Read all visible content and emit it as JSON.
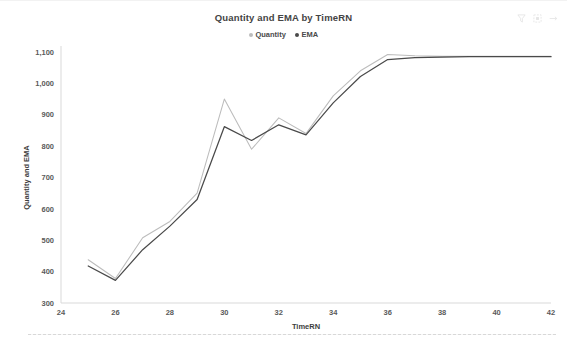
{
  "header": {
    "title": "Quantity and EMA by TimeRN",
    "icons": [
      {
        "name": "filter-icon",
        "label": "Filters"
      },
      {
        "name": "focus-mode-icon",
        "label": "Focus mode"
      },
      {
        "name": "more-options-icon",
        "label": "More options"
      }
    ]
  },
  "legend": {
    "items": [
      {
        "label": "Quantity",
        "color": "#bcbcbc"
      },
      {
        "label": "EMA",
        "color": "#4a4a4a"
      }
    ]
  },
  "colors": {
    "quantity": "#bcbcbc",
    "ema": "#4a4a4a",
    "axis": "#d9d9d9",
    "tick_text": "#5a5a5a",
    "title_text": "#444444",
    "background": "#ffffff"
  },
  "chart_data": {
    "type": "line",
    "title": "Quantity and EMA by TimeRN",
    "xlabel": "TimeRN",
    "ylabel": "Quantity and EMA",
    "xlim": [
      24,
      42
    ],
    "ylim": [
      300,
      1100
    ],
    "xticks": [
      24,
      26,
      28,
      30,
      32,
      34,
      36,
      38,
      40,
      42
    ],
    "xtick_labels": [
      "24",
      "26",
      "28",
      "30",
      "32",
      "34",
      "36",
      "38",
      "40",
      "42"
    ],
    "yticks": [
      300,
      400,
      500,
      600,
      700,
      800,
      900,
      1000,
      1100
    ],
    "ytick_labels": [
      "300",
      "400",
      "500",
      "600",
      "700",
      "800",
      "900",
      "1,000",
      "1,100"
    ],
    "grid": false,
    "legend_position": "top",
    "x": [
      25,
      26,
      27,
      28,
      29,
      30,
      31,
      32,
      33,
      34,
      35,
      36,
      37,
      38,
      39,
      40,
      41,
      42
    ],
    "series": [
      {
        "name": "Quantity",
        "color": "#bcbcbc",
        "values": [
          438,
          378,
          508,
          560,
          650,
          950,
          790,
          890,
          840,
          960,
          1040,
          1092,
          1088,
          1086,
          1086,
          1086,
          1086,
          1086
        ]
      },
      {
        "name": "EMA",
        "color": "#4a4a4a",
        "values": [
          418,
          372,
          470,
          545,
          630,
          862,
          818,
          868,
          836,
          938,
          1022,
          1076,
          1082,
          1084,
          1085,
          1085,
          1085,
          1085
        ]
      }
    ]
  }
}
